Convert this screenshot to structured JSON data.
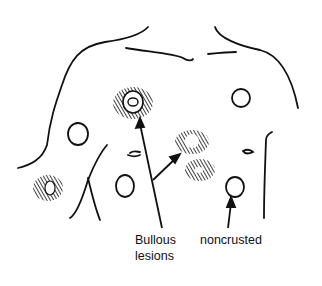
{
  "figure": {
    "labels": {
      "bullous_line1": "Bullous",
      "bullous_line2": "lesions",
      "noncrusted": "noncrusted"
    },
    "colors": {
      "ink": "#111111",
      "background": "#ffffff"
    }
  }
}
